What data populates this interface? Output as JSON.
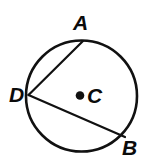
{
  "figure": {
    "background_color": "#ffffff",
    "stroke_color": "#111111",
    "labels": {
      "A": "A",
      "B": "B",
      "C": "C",
      "D": "D"
    },
    "circle": {
      "center_x": 81.5,
      "center_y": 96,
      "radius": 55.5,
      "stroke_width": 2.6
    },
    "center_dot": {
      "cx": 80,
      "cy": 95.5,
      "r": 4.3
    },
    "points": {
      "A": {
        "x": 83,
        "y": 41
      },
      "B": {
        "x": 125,
        "y": 137
      },
      "D": {
        "x": 28.5,
        "y": 95
      },
      "C": {
        "x": 80,
        "y": 95.5
      }
    },
    "chords": [
      {
        "name": "chord-DA",
        "from": "D",
        "to": "A",
        "stroke_width": 2.2
      },
      {
        "name": "chord-DB",
        "from": "D",
        "to": "B",
        "stroke_width": 2.2
      }
    ]
  }
}
